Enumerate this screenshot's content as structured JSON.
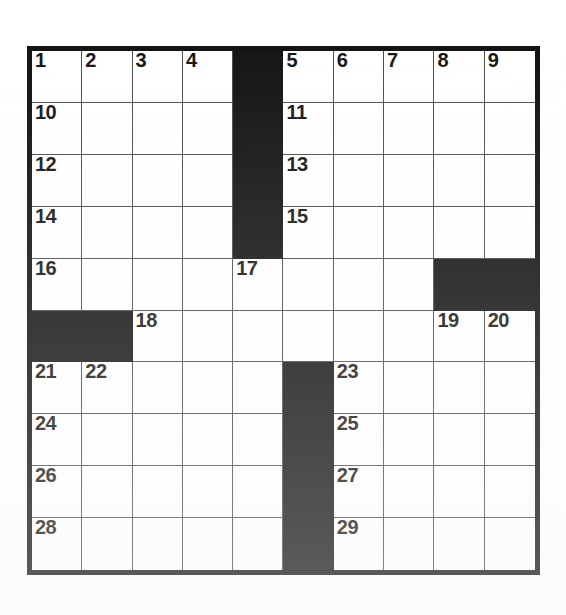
{
  "puzzle": {
    "type": "crossword-grid",
    "rows": 10,
    "columns": 10,
    "colors": {
      "block": "#0f0f0f",
      "cell": "#ffffff",
      "grid_line": "#4a4a4a",
      "outer_border": "#0d0d0d",
      "number_text": "#111111"
    },
    "grid": [
      [
        {
          "state": "white",
          "number": "1"
        },
        {
          "state": "white",
          "number": "2"
        },
        {
          "state": "white",
          "number": "3"
        },
        {
          "state": "white",
          "number": "4"
        },
        {
          "state": "block",
          "number": ""
        },
        {
          "state": "white",
          "number": "5"
        },
        {
          "state": "white",
          "number": "6"
        },
        {
          "state": "white",
          "number": "7"
        },
        {
          "state": "white",
          "number": "8"
        },
        {
          "state": "white",
          "number": "9"
        }
      ],
      [
        {
          "state": "white",
          "number": "10"
        },
        {
          "state": "white",
          "number": ""
        },
        {
          "state": "white",
          "number": ""
        },
        {
          "state": "white",
          "number": ""
        },
        {
          "state": "block",
          "number": ""
        },
        {
          "state": "white",
          "number": "11"
        },
        {
          "state": "white",
          "number": ""
        },
        {
          "state": "white",
          "number": ""
        },
        {
          "state": "white",
          "number": ""
        },
        {
          "state": "white",
          "number": ""
        }
      ],
      [
        {
          "state": "white",
          "number": "12"
        },
        {
          "state": "white",
          "number": ""
        },
        {
          "state": "white",
          "number": ""
        },
        {
          "state": "white",
          "number": ""
        },
        {
          "state": "block",
          "number": ""
        },
        {
          "state": "white",
          "number": "13"
        },
        {
          "state": "white",
          "number": ""
        },
        {
          "state": "white",
          "number": ""
        },
        {
          "state": "white",
          "number": ""
        },
        {
          "state": "white",
          "number": ""
        }
      ],
      [
        {
          "state": "white",
          "number": "14"
        },
        {
          "state": "white",
          "number": ""
        },
        {
          "state": "white",
          "number": ""
        },
        {
          "state": "white",
          "number": ""
        },
        {
          "state": "block",
          "number": ""
        },
        {
          "state": "white",
          "number": "15"
        },
        {
          "state": "white",
          "number": ""
        },
        {
          "state": "white",
          "number": ""
        },
        {
          "state": "white",
          "number": ""
        },
        {
          "state": "white",
          "number": ""
        }
      ],
      [
        {
          "state": "white",
          "number": "16"
        },
        {
          "state": "white",
          "number": ""
        },
        {
          "state": "white",
          "number": ""
        },
        {
          "state": "white",
          "number": ""
        },
        {
          "state": "white",
          "number": "17"
        },
        {
          "state": "white",
          "number": ""
        },
        {
          "state": "white",
          "number": ""
        },
        {
          "state": "white",
          "number": ""
        },
        {
          "state": "block",
          "number": ""
        },
        {
          "state": "block",
          "number": ""
        }
      ],
      [
        {
          "state": "block",
          "number": ""
        },
        {
          "state": "block",
          "number": ""
        },
        {
          "state": "white",
          "number": "18"
        },
        {
          "state": "white",
          "number": ""
        },
        {
          "state": "white",
          "number": ""
        },
        {
          "state": "white",
          "number": ""
        },
        {
          "state": "white",
          "number": ""
        },
        {
          "state": "white",
          "number": ""
        },
        {
          "state": "white",
          "number": "19"
        },
        {
          "state": "white",
          "number": "20"
        }
      ],
      [
        {
          "state": "white",
          "number": "21"
        },
        {
          "state": "white",
          "number": "22"
        },
        {
          "state": "white",
          "number": ""
        },
        {
          "state": "white",
          "number": ""
        },
        {
          "state": "white",
          "number": ""
        },
        {
          "state": "block",
          "number": ""
        },
        {
          "state": "white",
          "number": "23"
        },
        {
          "state": "white",
          "number": ""
        },
        {
          "state": "white",
          "number": ""
        },
        {
          "state": "white",
          "number": ""
        }
      ],
      [
        {
          "state": "white",
          "number": "24"
        },
        {
          "state": "white",
          "number": ""
        },
        {
          "state": "white",
          "number": ""
        },
        {
          "state": "white",
          "number": ""
        },
        {
          "state": "white",
          "number": ""
        },
        {
          "state": "block",
          "number": ""
        },
        {
          "state": "white",
          "number": "25"
        },
        {
          "state": "white",
          "number": ""
        },
        {
          "state": "white",
          "number": ""
        },
        {
          "state": "white",
          "number": ""
        }
      ],
      [
        {
          "state": "white",
          "number": "26"
        },
        {
          "state": "white",
          "number": ""
        },
        {
          "state": "white",
          "number": ""
        },
        {
          "state": "white",
          "number": ""
        },
        {
          "state": "white",
          "number": ""
        },
        {
          "state": "block",
          "number": ""
        },
        {
          "state": "white",
          "number": "27"
        },
        {
          "state": "white",
          "number": ""
        },
        {
          "state": "white",
          "number": ""
        },
        {
          "state": "white",
          "number": ""
        }
      ],
      [
        {
          "state": "white",
          "number": "28"
        },
        {
          "state": "white",
          "number": ""
        },
        {
          "state": "white",
          "number": ""
        },
        {
          "state": "white",
          "number": ""
        },
        {
          "state": "white",
          "number": ""
        },
        {
          "state": "block",
          "number": ""
        },
        {
          "state": "white",
          "number": "29"
        },
        {
          "state": "white",
          "number": ""
        },
        {
          "state": "white",
          "number": ""
        },
        {
          "state": "white",
          "number": ""
        }
      ]
    ]
  }
}
